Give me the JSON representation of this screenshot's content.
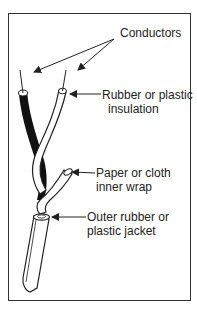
{
  "diagram": {
    "labels": {
      "conductors": "Conductors",
      "insulation_line1": "Rubber or plastic",
      "insulation_line2": "insulation",
      "wrap_line1": "Paper or cloth",
      "wrap_line2": "inner wrap",
      "jacket_line1": "Outer rubber or",
      "jacket_line2": "plastic jacket"
    },
    "colors": {
      "stroke": "#222222",
      "dark_insulation": "#111111",
      "light_insulation": "#ffffff",
      "frame": "#333333"
    }
  }
}
